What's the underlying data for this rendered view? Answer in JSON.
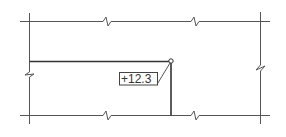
{
  "diagram": {
    "type": "plan-detail",
    "elevation_marker": {
      "label": "+12.3",
      "point_symbol": "circle"
    },
    "break_lines": {
      "top": 2,
      "bottom": 2,
      "left": 1,
      "right": 1
    },
    "colors": {
      "line": "#555555",
      "heavy_line": "#333333",
      "background": "#ffffff"
    }
  }
}
